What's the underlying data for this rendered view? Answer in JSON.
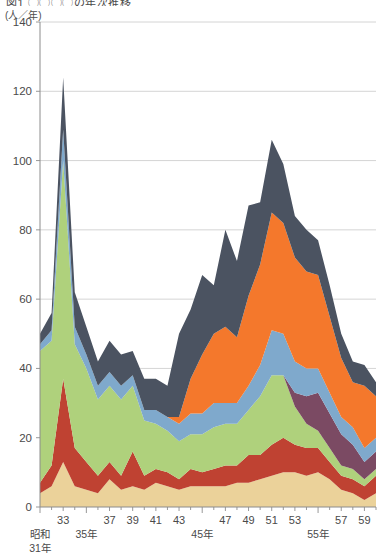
{
  "figure": {
    "title_partial": "図1  ◯◯◯◯の年次推移",
    "unit_label": "(人／年)"
  },
  "chart_data": {
    "type": "area",
    "stacked": true,
    "title": "図1  ◯◯◯◯の年次推移",
    "xlabel": "",
    "ylabel": "(人／年)",
    "ylim": [
      0,
      140
    ],
    "yticks": [
      0,
      20,
      40,
      60,
      80,
      100,
      120,
      140
    ],
    "grid": true,
    "legend": "none",
    "x": [
      31,
      32,
      33,
      34,
      35,
      36,
      37,
      38,
      39,
      40,
      41,
      42,
      43,
      44,
      45,
      46,
      47,
      48,
      49,
      50,
      51,
      52,
      53,
      54,
      55,
      56,
      57,
      58,
      59,
      60
    ],
    "xticks_major": [
      {
        "value": 31,
        "label": "昭和\n31年"
      },
      {
        "value": 35,
        "label": "35年"
      },
      {
        "value": 45,
        "label": "45年"
      },
      {
        "value": 55,
        "label": "55年"
      }
    ],
    "xticks_minor": [
      {
        "value": 33,
        "label": "33"
      },
      {
        "value": 37,
        "label": "37"
      },
      {
        "value": 39,
        "label": "39"
      },
      {
        "value": 41,
        "label": "41"
      },
      {
        "value": 43,
        "label": "43"
      },
      {
        "value": 47,
        "label": "47"
      },
      {
        "value": 49,
        "label": "49"
      },
      {
        "value": 51,
        "label": "51"
      },
      {
        "value": 53,
        "label": "53"
      },
      {
        "value": 57,
        "label": "57"
      },
      {
        "value": 59,
        "label": "59"
      }
    ],
    "stack_order_bottom_to_top": [
      "tan",
      "red",
      "green",
      "purple",
      "blue",
      "orange",
      "navy"
    ],
    "series": [
      {
        "name": "tan",
        "color": "#EBD29A",
        "values": [
          4,
          6,
          13,
          6,
          5,
          4,
          8,
          5,
          6,
          5,
          7,
          6,
          5,
          6,
          6,
          6,
          6,
          7,
          7,
          8,
          9,
          10,
          10,
          9,
          10,
          8,
          5,
          4,
          2,
          4
        ]
      },
      {
        "name": "red",
        "color": "#BF4232",
        "values": [
          3,
          6,
          24,
          11,
          8,
          5,
          5,
          4,
          10,
          4,
          4,
          4,
          3,
          5,
          4,
          5,
          6,
          5,
          8,
          7,
          9,
          10,
          8,
          8,
          7,
          5,
          4,
          4,
          4,
          5
        ]
      },
      {
        "name": "green",
        "color": "#AFD17C",
        "values": [
          38,
          36,
          63,
          30,
          27,
          22,
          22,
          22,
          19,
          16,
          13,
          12,
          11,
          10,
          11,
          12,
          12,
          12,
          13,
          17,
          20,
          18,
          11,
          7,
          5,
          4,
          3,
          3,
          2,
          2
        ]
      },
      {
        "name": "purple",
        "color": "#7B4A63",
        "values": [
          0,
          0,
          0,
          0,
          0,
          0,
          0,
          0,
          0,
          0,
          0,
          0,
          0,
          0,
          0,
          0,
          0,
          0,
          0,
          0,
          0,
          0,
          4,
          8,
          11,
          10,
          9,
          7,
          5,
          5
        ]
      },
      {
        "name": "blue",
        "color": "#7FA9CC",
        "values": [
          2,
          3,
          9,
          5,
          4,
          4,
          4,
          4,
          3,
          3,
          4,
          4,
          5,
          6,
          6,
          7,
          6,
          6,
          7,
          9,
          13,
          12,
          9,
          8,
          7,
          6,
          5,
          5,
          4,
          4
        ]
      },
      {
        "name": "orange",
        "color": "#F4782C",
        "values": [
          0,
          0,
          0,
          0,
          0,
          0,
          0,
          0,
          0,
          0,
          0,
          0,
          2,
          10,
          17,
          20,
          22,
          19,
          26,
          29,
          34,
          32,
          30,
          28,
          27,
          22,
          17,
          13,
          18,
          12
        ]
      },
      {
        "name": "navy",
        "color": "#4B5361",
        "values": [
          3,
          5,
          15,
          10,
          8,
          7,
          9,
          9,
          7,
          9,
          9,
          9,
          24,
          20,
          23,
          14,
          28,
          22,
          26,
          18,
          21,
          17,
          12,
          12,
          10,
          9,
          7,
          6,
          6,
          4
        ]
      }
    ]
  }
}
